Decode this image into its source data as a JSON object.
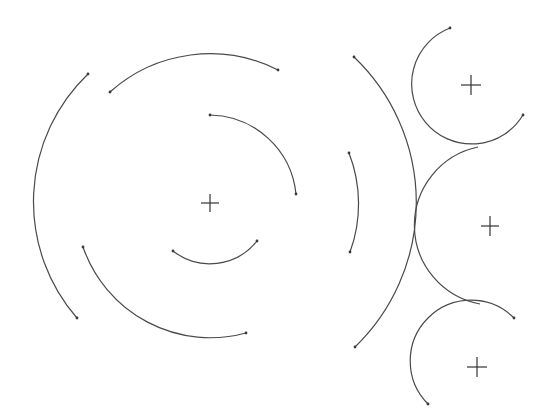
{
  "diagram": {
    "stroke_color": "#4a4a4a",
    "background": "#ffffff",
    "centers": [
      {
        "name": "concentric-center",
        "x": 210,
        "y": 203
      },
      {
        "name": "top-circle-center",
        "x": 471,
        "y": 85
      },
      {
        "name": "middle-circle-center",
        "x": 490,
        "y": 226
      },
      {
        "name": "bottom-circle-center",
        "x": 477,
        "y": 367
      }
    ],
    "arcs": [
      {
        "name": "outer-left-arc",
        "start": [
          88,
          74
        ],
        "end": [
          77,
          318
        ],
        "radius": 177
      },
      {
        "name": "top-arc",
        "start": [
          110,
          92
        ],
        "end": [
          278,
          70
        ],
        "radius": 150
      },
      {
        "name": "lower-left-arc",
        "start": [
          83,
          247
        ],
        "end": [
          246,
          333
        ],
        "radius": 135
      },
      {
        "name": "inner-upper-arc",
        "start": [
          210,
          115
        ],
        "end": [
          296,
          194
        ],
        "radius": 88
      },
      {
        "name": "inner-lower-arc",
        "start": [
          173,
          251
        ],
        "end": [
          257,
          241
        ],
        "radius": 60
      },
      {
        "name": "right-short-arc",
        "start": [
          349,
          153
        ],
        "end": [
          350,
          252
        ],
        "radius": 140
      },
      {
        "name": "large-right-arc",
        "start": [
          354,
          57
        ],
        "end": [
          355,
          347
        ],
        "radius": 201
      },
      {
        "name": "top-circle-arc",
        "start": [
          450,
          28
        ],
        "end": [
          523,
          115
        ],
        "radius": 60
      },
      {
        "name": "middle-circle-arc",
        "start": [
          478,
          147
        ],
        "end": [
          480,
          304
        ],
        "radius": 80
      },
      {
        "name": "bottom-circle-arc",
        "start": [
          514,
          318
        ],
        "end": [
          428,
          404
        ],
        "radius": 60
      }
    ]
  }
}
